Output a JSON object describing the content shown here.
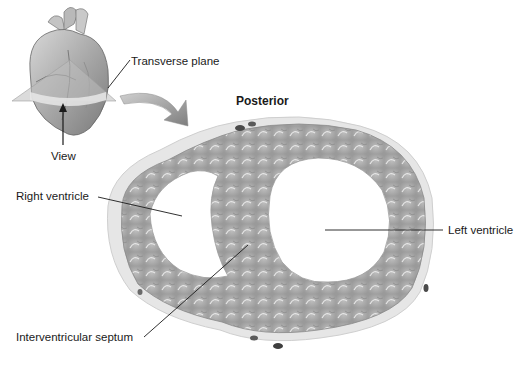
{
  "figure": {
    "orientation_label": "Posterior",
    "labels": {
      "transverse_plane": "Transverse plane",
      "view": "View",
      "right_ventricle": "Right ventricle",
      "left_ventricle": "Left ventricle",
      "interventricular_septum": "Interventricular septum"
    },
    "colors": {
      "background": "#ffffff",
      "myocardium": "#a9a9a9",
      "myocardium_light": "#c8c8c8",
      "epicardial_fat": "#e4e4e4",
      "plane": "#bdbdbd",
      "arrow": "#8a8a8a",
      "leader_line": "#1a1a1a",
      "text": "#1a1a1a"
    }
  }
}
